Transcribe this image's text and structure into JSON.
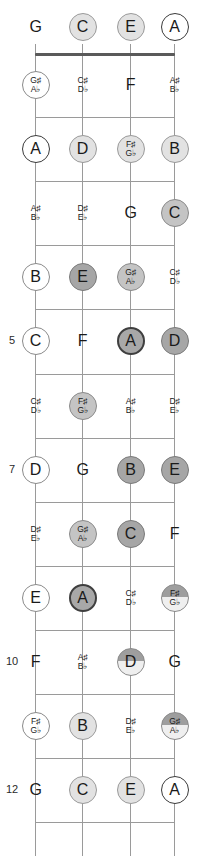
{
  "diagram": {
    "instrument": "ukulele-fretboard",
    "orientation": "vertical",
    "tuning": [
      "G",
      "C",
      "E",
      "A"
    ],
    "fret_numbers": {
      "5": "5",
      "7": "7",
      "10": "10",
      "12": "12"
    },
    "colors": {
      "line": "#9a9a9a",
      "nut": "#5a5a5a",
      "text": "#1a1a1a",
      "open_ring": "#3a3a3a",
      "light_fill": "#e2e2e2",
      "mid_fill": "#c4c4c4",
      "dark_fill": "#a6a6a6"
    },
    "accidental_sharp": "♯",
    "accidental_flat": "♭"
  },
  "strings": [
    {
      "name": "G",
      "x": 35
    },
    {
      "name": "C",
      "x": 82
    },
    {
      "name": "E",
      "x": 130
    },
    {
      "name": "A",
      "x": 174
    }
  ],
  "frets": [
    {
      "fret": 0,
      "label": "",
      "notes": [
        {
          "string": "G",
          "natural": "G",
          "sharp": "",
          "flat": "",
          "marker": "none"
        },
        {
          "string": "C",
          "natural": "C",
          "sharp": "",
          "flat": "",
          "marker": "light"
        },
        {
          "string": "E",
          "natural": "E",
          "sharp": "",
          "flat": "",
          "marker": "light"
        },
        {
          "string": "A",
          "natural": "A",
          "sharp": "",
          "flat": "",
          "marker": "open"
        }
      ]
    },
    {
      "fret": 1,
      "label": "",
      "notes": [
        {
          "string": "G",
          "natural": "",
          "sharp": "G♯",
          "flat": "A♭",
          "marker": "white"
        },
        {
          "string": "C",
          "natural": "",
          "sharp": "C♯",
          "flat": "D♭",
          "marker": "none"
        },
        {
          "string": "E",
          "natural": "F",
          "sharp": "",
          "flat": "",
          "marker": "none"
        },
        {
          "string": "A",
          "natural": "",
          "sharp": "A♯",
          "flat": "B♭",
          "marker": "none"
        }
      ]
    },
    {
      "fret": 2,
      "label": "",
      "notes": [
        {
          "string": "G",
          "natural": "A",
          "sharp": "",
          "flat": "",
          "marker": "open"
        },
        {
          "string": "C",
          "natural": "D",
          "sharp": "",
          "flat": "",
          "marker": "light"
        },
        {
          "string": "E",
          "natural": "",
          "sharp": "F♯",
          "flat": "G♭",
          "marker": "light"
        },
        {
          "string": "A",
          "natural": "B",
          "sharp": "",
          "flat": "",
          "marker": "light"
        }
      ]
    },
    {
      "fret": 3,
      "label": "",
      "notes": [
        {
          "string": "G",
          "natural": "",
          "sharp": "A♯",
          "flat": "B♭",
          "marker": "none"
        },
        {
          "string": "C",
          "natural": "",
          "sharp": "D♯",
          "flat": "E♭",
          "marker": "none"
        },
        {
          "string": "E",
          "natural": "G",
          "sharp": "",
          "flat": "",
          "marker": "none"
        },
        {
          "string": "A",
          "natural": "C",
          "sharp": "",
          "flat": "",
          "marker": "mid"
        }
      ]
    },
    {
      "fret": 4,
      "label": "",
      "notes": [
        {
          "string": "G",
          "natural": "B",
          "sharp": "",
          "flat": "",
          "marker": "white"
        },
        {
          "string": "C",
          "natural": "E",
          "sharp": "",
          "flat": "",
          "marker": "dark"
        },
        {
          "string": "E",
          "natural": "",
          "sharp": "G♯",
          "flat": "A♭",
          "marker": "mid"
        },
        {
          "string": "A",
          "natural": "",
          "sharp": "C♯",
          "flat": "D♭",
          "marker": "none"
        }
      ]
    },
    {
      "fret": 5,
      "label": "5",
      "notes": [
        {
          "string": "G",
          "natural": "C",
          "sharp": "",
          "flat": "",
          "marker": "white"
        },
        {
          "string": "C",
          "natural": "F",
          "sharp": "",
          "flat": "",
          "marker": "none"
        },
        {
          "string": "E",
          "natural": "A",
          "sharp": "",
          "flat": "",
          "marker": "darkring"
        },
        {
          "string": "A",
          "natural": "D",
          "sharp": "",
          "flat": "",
          "marker": "dark"
        }
      ]
    },
    {
      "fret": 6,
      "label": "",
      "notes": [
        {
          "string": "G",
          "natural": "",
          "sharp": "C♯",
          "flat": "D♭",
          "marker": "none"
        },
        {
          "string": "C",
          "natural": "",
          "sharp": "F♯",
          "flat": "G♭",
          "marker": "mid"
        },
        {
          "string": "E",
          "natural": "",
          "sharp": "A♯",
          "flat": "B♭",
          "marker": "none"
        },
        {
          "string": "A",
          "natural": "",
          "sharp": "D♯",
          "flat": "E♭",
          "marker": "none"
        }
      ]
    },
    {
      "fret": 7,
      "label": "7",
      "notes": [
        {
          "string": "G",
          "natural": "D",
          "sharp": "",
          "flat": "",
          "marker": "white"
        },
        {
          "string": "C",
          "natural": "G",
          "sharp": "",
          "flat": "",
          "marker": "none"
        },
        {
          "string": "E",
          "natural": "B",
          "sharp": "",
          "flat": "",
          "marker": "dark"
        },
        {
          "string": "A",
          "natural": "E",
          "sharp": "",
          "flat": "",
          "marker": "dark"
        }
      ]
    },
    {
      "fret": 8,
      "label": "",
      "notes": [
        {
          "string": "G",
          "natural": "",
          "sharp": "D♯",
          "flat": "E♭",
          "marker": "none"
        },
        {
          "string": "C",
          "natural": "",
          "sharp": "G♯",
          "flat": "A♭",
          "marker": "mid"
        },
        {
          "string": "E",
          "natural": "C",
          "sharp": "",
          "flat": "",
          "marker": "dark"
        },
        {
          "string": "A",
          "natural": "F",
          "sharp": "",
          "flat": "",
          "marker": "none"
        }
      ]
    },
    {
      "fret": 9,
      "label": "",
      "notes": [
        {
          "string": "G",
          "natural": "E",
          "sharp": "",
          "flat": "",
          "marker": "white"
        },
        {
          "string": "C",
          "natural": "A",
          "sharp": "",
          "flat": "",
          "marker": "darkring"
        },
        {
          "string": "E",
          "natural": "",
          "sharp": "C♯",
          "flat": "D♭",
          "marker": "none"
        },
        {
          "string": "A",
          "natural": "",
          "sharp": "F♯",
          "flat": "G♭",
          "marker": "halftop"
        }
      ]
    },
    {
      "fret": 10,
      "label": "10",
      "notes": [
        {
          "string": "G",
          "natural": "F",
          "sharp": "",
          "flat": "",
          "marker": "none"
        },
        {
          "string": "C",
          "natural": "",
          "sharp": "A♯",
          "flat": "B♭",
          "marker": "none"
        },
        {
          "string": "E",
          "natural": "D",
          "sharp": "",
          "flat": "",
          "marker": "halftop"
        },
        {
          "string": "A",
          "natural": "G",
          "sharp": "",
          "flat": "",
          "marker": "none"
        }
      ]
    },
    {
      "fret": 11,
      "label": "",
      "notes": [
        {
          "string": "G",
          "natural": "",
          "sharp": "F♯",
          "flat": "G♭",
          "marker": "white"
        },
        {
          "string": "C",
          "natural": "B",
          "sharp": "",
          "flat": "",
          "marker": "light"
        },
        {
          "string": "E",
          "natural": "",
          "sharp": "D♯",
          "flat": "E♭",
          "marker": "none"
        },
        {
          "string": "A",
          "natural": "",
          "sharp": "G♯",
          "flat": "A♭",
          "marker": "halftop"
        }
      ]
    },
    {
      "fret": 12,
      "label": "12",
      "notes": [
        {
          "string": "G",
          "natural": "G",
          "sharp": "",
          "flat": "",
          "marker": "none"
        },
        {
          "string": "C",
          "natural": "C",
          "sharp": "",
          "flat": "",
          "marker": "light"
        },
        {
          "string": "E",
          "natural": "E",
          "sharp": "",
          "flat": "",
          "marker": "light"
        },
        {
          "string": "A",
          "natural": "A",
          "sharp": "",
          "flat": "",
          "marker": "open"
        }
      ]
    }
  ]
}
